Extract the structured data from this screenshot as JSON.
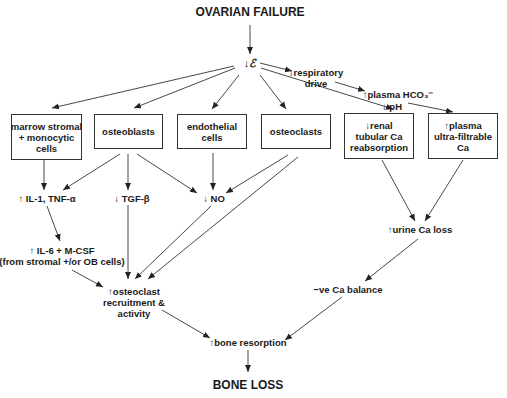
{
  "diagram": {
    "title": "OVARIAN FAILURE",
    "footer": "BONE LOSS",
    "nodes": {
      "estrogen": "↓ℰ",
      "respiratory": "↓respiratory\ndrive",
      "hco3": "↑plasma HCO₃⁻",
      "ph": "↓ pH",
      "marrow": "marrow stromal\n+ monocytic\ncells",
      "osteoblasts": "osteoblasts",
      "endothelial": "endothelial\ncells",
      "osteoclasts": "osteoclasts",
      "renal": "↓renal\ntubular Ca\nreabsorption",
      "ultrafiltrable": "↑plasma\nultra-filtrable\nCa",
      "il1": "↑ IL-1, TNF-α",
      "tgf": "↓ TGF-β",
      "no": "↓ NO",
      "il6": "↑ IL-6 + M-CSF\n(from stromal +/or OB cells)",
      "urine": "↑urine Ca loss",
      "recruit": "↑osteoclast\nrecruitment &\nactivity",
      "balance": "−ve Ca balance",
      "resorption": "↑bone resorption"
    }
  }
}
